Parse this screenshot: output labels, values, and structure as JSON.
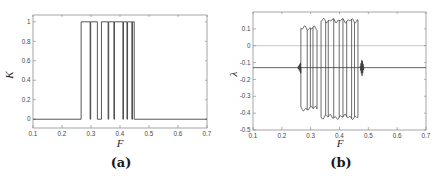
{
  "figure": {
    "background": "#ffffff",
    "line_color": "#3a3a3a",
    "axis_color": "#8f8f8f",
    "zero_line_color": "#aeaeae",
    "tick_label_color": "#474747"
  },
  "captions": {
    "a": "(a)",
    "b": "(b)"
  },
  "chart_data": [
    {
      "type": "line",
      "panel": "a",
      "title": "",
      "xlabel": "F",
      "ylabel": "K",
      "xlim": [
        0.1,
        0.7
      ],
      "ylim": [
        -0.09,
        1.07
      ],
      "x_ticks": [
        0.1,
        0.2,
        0.3,
        0.4,
        0.5,
        0.6,
        0.7
      ],
      "x_tick_labels": [
        "0.1",
        "0.2",
        "0.3",
        "0.4",
        "0.5",
        "0.6",
        "0.7"
      ],
      "y_ticks": [
        0,
        0.2,
        0.4,
        0.6,
        0.8,
        1
      ],
      "y_tick_labels": [
        "0",
        "0.2",
        "0.4",
        "0.6",
        "0.8",
        "1"
      ],
      "grid": false,
      "baseline": 0,
      "high": 1,
      "pulses": [
        [
          0.266,
          0.297
        ],
        [
          0.299,
          0.322
        ],
        [
          0.336,
          0.359
        ],
        [
          0.361,
          0.379
        ],
        [
          0.381,
          0.41
        ],
        [
          0.412,
          0.424
        ],
        [
          0.426,
          0.441
        ],
        [
          0.443,
          0.449
        ]
      ],
      "series_name": "K(F) binary switching signal: 0 outside window, 1 pulses between F=0.266 and F=0.449"
    },
    {
      "type": "line",
      "panel": "b",
      "title": "",
      "xlabel": "F",
      "ylabel": "λ",
      "xlim": [
        0.1,
        0.7
      ],
      "ylim": [
        -0.5,
        0.2
      ],
      "x_ticks": [
        0.1,
        0.2,
        0.3,
        0.4,
        0.5,
        0.6,
        0.7
      ],
      "x_tick_labels": [
        "0.1",
        "0.2",
        "0.3",
        "0.4",
        "0.5",
        "0.6",
        "0.7"
      ],
      "y_ticks": [
        0.1,
        0,
        -0.1,
        -0.2,
        -0.3,
        -0.4,
        -0.5
      ],
      "y_tick_labels": [
        "0.1",
        "0",
        "-0.1",
        "-0.2",
        "-0.3",
        "-0.4",
        "-0.5"
      ],
      "grid": false,
      "zero_line": 0,
      "baseline": -0.13,
      "pre_fuzz": {
        "start": 0.25,
        "end": 0.266,
        "max_amp": 0.035
      },
      "bands": [
        {
          "start": 0.266,
          "end": 0.322,
          "top": 0.12,
          "bottom": -0.39,
          "connectors": [
            0.288,
            0.299,
            0.308
          ]
        },
        {
          "start": 0.336,
          "end": 0.464,
          "top": 0.165,
          "bottom": -0.44,
          "connectors": [
            0.352,
            0.361,
            0.38,
            0.399,
            0.412,
            0.425,
            0.442,
            0.452
          ]
        }
      ],
      "spike": {
        "center": 0.478,
        "halfwidth": 0.007,
        "amp": 0.05
      },
      "series_name": "Lyapunov exponent λ(F): ≈ -0.13 outside control window, oscillates between ≈ 0.16 and ≈ -0.44 inside"
    }
  ]
}
